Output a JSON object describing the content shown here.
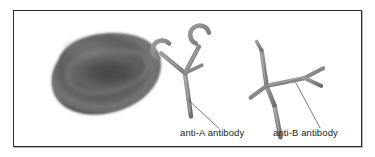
{
  "figure": {
    "background_color": "#ffffff",
    "border_color": "#2a2a2a",
    "shadow_color": "#b8b8b8"
  },
  "cell": {
    "name": "red-blood-cell",
    "shape": "biconcave disc",
    "fill_dark": "#4f4f4f",
    "fill_mid": "#5f5f5f",
    "rim_highlight": "#7b7b7b",
    "dimple_color": "#474747",
    "outline_color": "#3a3a3a"
  },
  "antibodies": [
    {
      "id": "anti-a",
      "label": "anti-A antibody",
      "tip_style": "crescent",
      "stroke_color": "#8a8a8a",
      "edge_color": "#5d5d5d",
      "highlight_color": "#b5b5b5"
    },
    {
      "id": "anti-b",
      "label": "anti-B antibody",
      "tip_style": "fork",
      "stroke_color": "#8a8a8a",
      "edge_color": "#5d5d5d",
      "highlight_color": "#b5b5b5"
    }
  ],
  "leader_lines": {
    "color": "#3d3d3d",
    "width": 0.7
  },
  "labels": {
    "anti_a": "anti-A antibody",
    "anti_b": "anti-B antibody"
  }
}
